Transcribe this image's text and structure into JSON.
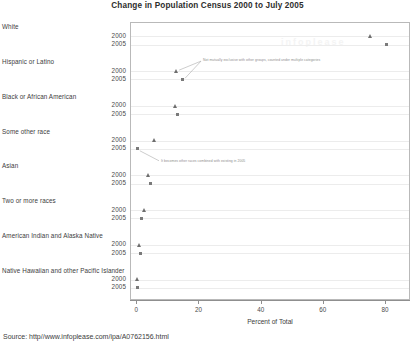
{
  "chart_data": {
    "type": "scatter",
    "title": "Change in Population Census 2000 to July 2005",
    "xlabel": "Percent of Total",
    "ylabel": "",
    "xlim": [
      -2,
      88
    ],
    "xticks": [
      0,
      20,
      40,
      60,
      80
    ],
    "grid": true,
    "legend_position": "none",
    "categories": [
      "White",
      "Hispanic or Latino",
      "Black or African American",
      "Some other race",
      "Asian",
      "Two or more races",
      "American Indian and Alaska Native",
      "Native Hawaiian and other Pacific Islander"
    ],
    "series": [
      {
        "name": "2000",
        "marker": "triangle",
        "values": [
          75.1,
          12.5,
          12.3,
          5.5,
          3.6,
          2.4,
          0.9,
          0.1
        ]
      },
      {
        "name": "2005",
        "marker": "square",
        "values": [
          80.2,
          14.4,
          12.8,
          0.2,
          4.3,
          1.5,
          1.0,
          0.2
        ]
      }
    ],
    "row_labels": [
      "2000",
      "2005"
    ],
    "annotations": [
      {
        "text": "Not mutually exclusive with other groups, counted under multiple categories",
        "target_categories": [
          "Hispanic or Latino"
        ]
      },
      {
        "text": "It becomes other races combined with existing in 2005",
        "target_categories": [
          "Some other race"
        ]
      }
    ],
    "watermark": "infoplease"
  },
  "source": {
    "label": "Source: http//www.infoplease.com/ipa/A0762156.html"
  }
}
